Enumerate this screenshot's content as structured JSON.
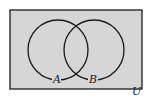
{
  "diagram": {
    "type": "venn",
    "universe_label": "U",
    "sets": [
      {
        "label": "A",
        "cx": 58,
        "cy": 50,
        "r": 30
      },
      {
        "label": "B",
        "cx": 94,
        "cy": 50,
        "r": 30
      }
    ],
    "shaded_region": "U (entire universe)",
    "colors": {
      "fill": "#d6d6d6",
      "stroke": "#1a1a1a",
      "background": "#ffffff"
    }
  }
}
